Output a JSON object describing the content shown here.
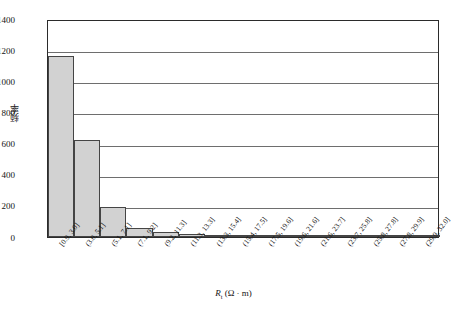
{
  "chart_data": {
    "type": "bar",
    "title": "",
    "subtitle": "",
    "xlabel": "R_t (Ω · m)",
    "ylabel": "频率",
    "ylim": [
      0,
      1400
    ],
    "ytick_values": [
      0,
      200,
      400,
      600,
      800,
      1000,
      1200,
      1400
    ],
    "ytick_labels": [
      "0",
      "200",
      "400",
      "600",
      "800",
      "1000",
      "1200",
      "1400"
    ],
    "grid": "horizontal",
    "legend": "none",
    "bar_fill_color": "#d2d2d2",
    "bar_edge_color": "#454545",
    "categories": [
      "[0.9, 3.0]",
      "(3.0, 5.1]",
      "(5.1, 7.1]",
      "(7.1, 9.2]",
      "(9.2, 11.3]",
      "(11.3, 13.3]",
      "(13.3, 15.4]",
      "(15.4, 17.5]",
      "(17.5, 19.6]",
      "(19.6, 21.6]",
      "(21.6, 23.7]",
      "(23.7, 25.8]",
      "(25.8, 27.8]",
      "(27.8, 29.9]",
      "(29.9, 32.0]"
    ],
    "values": [
      1160,
      620,
      190,
      60,
      30,
      18,
      14,
      10,
      8,
      6,
      5,
      4,
      14,
      6,
      3
    ]
  },
  "axis_title_x": {
    "symbol": "R",
    "subscript": "t",
    "units": " (Ω · m)"
  }
}
